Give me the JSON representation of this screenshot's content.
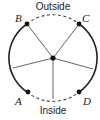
{
  "diagram": {
    "labels": {
      "top": "Outside",
      "bottom": "Inside"
    },
    "points": [
      {
        "id": "B",
        "label": "B"
      },
      {
        "id": "C",
        "label": "C"
      },
      {
        "id": "A",
        "label": "A"
      },
      {
        "id": "D",
        "label": "D"
      }
    ],
    "colors": {
      "stroke": "#222222",
      "spokes": "#555555"
    }
  }
}
